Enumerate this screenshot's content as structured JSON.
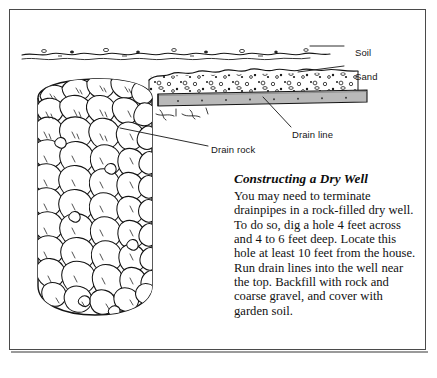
{
  "figure": {
    "title": "Constructing a Dry Well",
    "callouts": [
      {
        "id": "soil",
        "label": "Soil",
        "name": "callout-label-soil"
      },
      {
        "id": "sand",
        "label": "Sand",
        "name": "callout-label-sand"
      },
      {
        "id": "drain_line",
        "label": "Drain line",
        "name": "callout-label-drain-line"
      },
      {
        "id": "drain_rock",
        "label": "Drain rock",
        "name": "callout-label-drain-rock"
      }
    ],
    "soil_label": "Soil",
    "sand_label": "Sand",
    "drain_line_label": "Drain line",
    "drain_rock_label": "Drain rock"
  },
  "article": {
    "heading": "Constructing a Dry Well",
    "body": "You may need to terminate drainpipes in a rock-filled dry well. To do so, dig a hole 4 feet across and 4 to 6 feet deep. Locate this hole at least 10 feet from the house. Run drain lines into the well near the top. Backfill with rock and coarse gravel, and cover with garden soil."
  },
  "colors": {
    "ink": "#111111",
    "frame_border": "#4a4a4a",
    "pipe_fill": "#b9b9b9",
    "page_background": "#ffffff"
  }
}
